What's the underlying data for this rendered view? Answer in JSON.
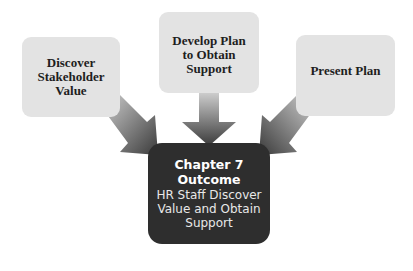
{
  "diagram": {
    "inputs": [
      {
        "label": "Discover\nStakeholder\nValue"
      },
      {
        "label": "Develop Plan\nto Obtain\nSupport"
      },
      {
        "label": "Present Plan"
      }
    ],
    "outcome": {
      "title": "Chapter 7\nOutcome",
      "subtitle": "HR Staff Discover\nValue and Obtain\nSupport"
    },
    "colors": {
      "input_box": "#e3e3e3",
      "outcome_box": "#2e2e2e",
      "arrow_dark": "#3a3a3a",
      "arrow_light": "#d8d8d8"
    }
  }
}
